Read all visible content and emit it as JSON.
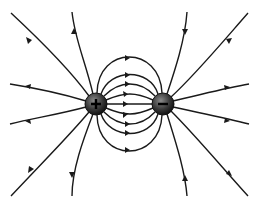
{
  "diagram": {
    "charges": [
      {
        "id": "positive",
        "sign": "+",
        "cx": 96,
        "cy": 104,
        "r": 11
      },
      {
        "id": "negative",
        "sign": "−",
        "cx": 163,
        "cy": 104,
        "r": 11
      }
    ],
    "line_color": "#1a1a1a",
    "charge_fill": "#3a3a3a"
  }
}
